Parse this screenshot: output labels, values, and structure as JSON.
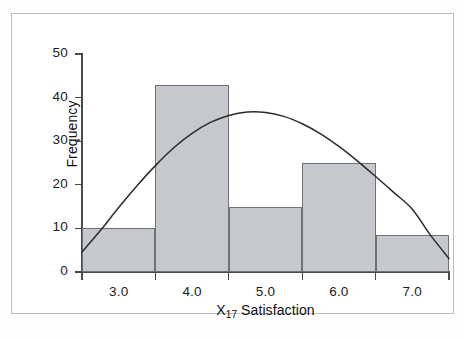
{
  "chart_data": {
    "type": "bar",
    "title": "",
    "subtitle": "",
    "xlabel": "X17 Satisfaction",
    "xlabel_main": "X",
    "xlabel_sub": "17",
    "xlabel_rest": " Satisfaction",
    "ylabel": "Frequency",
    "xlim": [
      2.5,
      7.5
    ],
    "ylim": [
      0,
      50
    ],
    "grid": false,
    "legend": null,
    "bin_edges": [
      2.5,
      3.5,
      4.5,
      5.5,
      6.5,
      7.5
    ],
    "bin_centers": [
      3.0,
      4.0,
      5.0,
      6.0,
      7.0
    ],
    "categories": [
      "3.0",
      "4.0",
      "5.0",
      "6.0",
      "7.0"
    ],
    "values": [
      10,
      43,
      15,
      25,
      8.5
    ],
    "bar_color": "#c5c8cd",
    "bar_edge_color": "#6e7277",
    "x_tick_labels": [
      "3.0",
      "4.0",
      "5.0",
      "6.0",
      "7.0"
    ],
    "x_tick_positions": [
      3.0,
      4.0,
      5.0,
      6.0,
      7.0
    ],
    "y_tick_labels": [
      "0",
      "10",
      "20",
      "30",
      "40",
      "50"
    ],
    "y_tick_positions": [
      0,
      10,
      20,
      30,
      40,
      50
    ],
    "overlay": {
      "type": "line",
      "name": "normal-curve",
      "color": "#2b2b2b",
      "points": [
        {
          "x": 2.5,
          "y": 4.6
        },
        {
          "x": 2.75,
          "y": 9.5
        },
        {
          "x": 3.0,
          "y": 14.8
        },
        {
          "x": 3.25,
          "y": 19.8
        },
        {
          "x": 3.5,
          "y": 24.4
        },
        {
          "x": 3.75,
          "y": 28.5
        },
        {
          "x": 4.0,
          "y": 31.8
        },
        {
          "x": 4.25,
          "y": 34.3
        },
        {
          "x": 4.5,
          "y": 35.9
        },
        {
          "x": 4.75,
          "y": 36.7
        },
        {
          "x": 5.0,
          "y": 36.6
        },
        {
          "x": 5.25,
          "y": 35.7
        },
        {
          "x": 5.5,
          "y": 34.0
        },
        {
          "x": 5.75,
          "y": 31.7
        },
        {
          "x": 6.0,
          "y": 28.8
        },
        {
          "x": 6.25,
          "y": 25.5
        },
        {
          "x": 6.5,
          "y": 21.9
        },
        {
          "x": 6.75,
          "y": 18.2
        },
        {
          "x": 7.0,
          "y": 14.4
        },
        {
          "x": 7.25,
          "y": 8.4
        },
        {
          "x": 7.5,
          "y": 3.1
        }
      ]
    }
  },
  "figure": {
    "border_color": "#b9bec4",
    "background": "#ffffff"
  }
}
